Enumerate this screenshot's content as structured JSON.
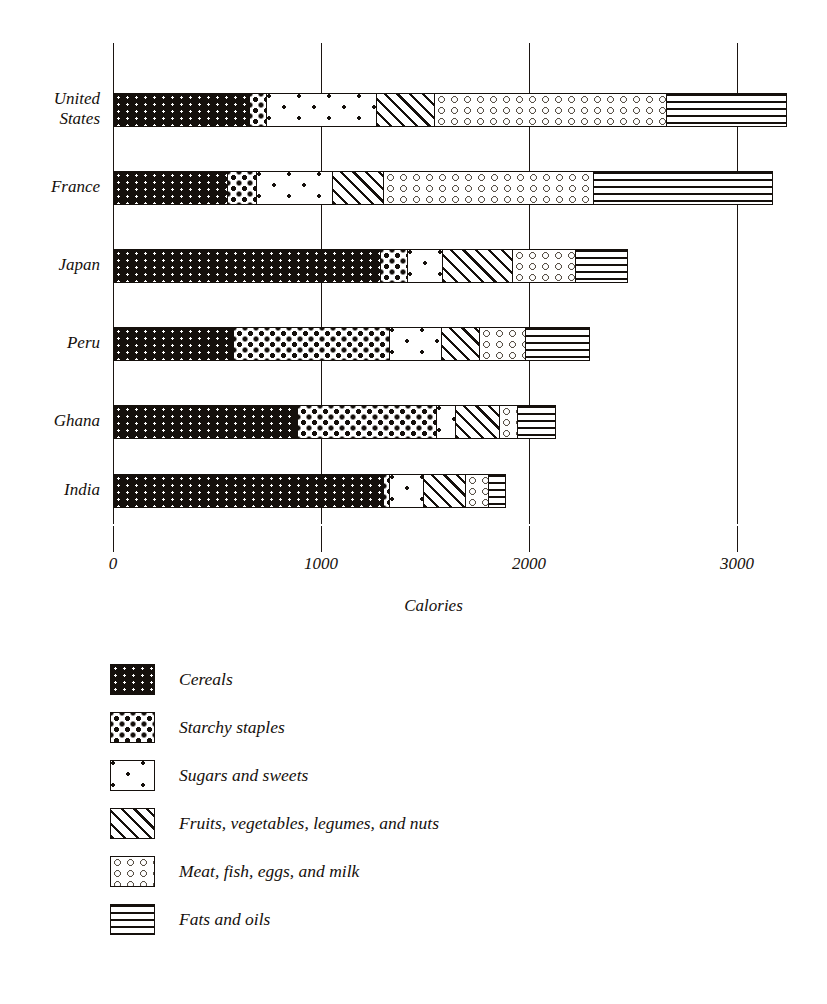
{
  "chart_data": {
    "type": "bar",
    "orientation": "horizontal",
    "stacked": true,
    "title": "",
    "xlabel": "Calories",
    "ylabel": "",
    "xlim": [
      0,
      3400
    ],
    "xticks": [
      0,
      1000,
      2000,
      3000
    ],
    "xticklabels": [
      "0",
      "1000",
      "2000",
      "3000"
    ],
    "grid": "vertical gridlines at each x tick",
    "legend_position": "below plot, left aligned",
    "categories": [
      "United States",
      "France",
      "Japan",
      "Peru",
      "Ghana",
      "India"
    ],
    "series": [
      {
        "name": "Cereals",
        "pattern": "chevron-zigzag",
        "values": [
          654,
          548,
          1288,
          577,
          889,
          1303
        ]
      },
      {
        "name": "Starchy staples",
        "pattern": "dense-dots",
        "values": [
          86,
          144,
          130,
          755,
          671,
          29
        ]
      },
      {
        "name": "Sugars and sweets",
        "pattern": "asterisks",
        "values": [
          529,
          365,
          168,
          250,
          91,
          168
        ]
      },
      {
        "name": "Fruits, vegetables, legumes, and nuts",
        "pattern": "diagonal-hatch",
        "values": [
          279,
          245,
          341,
          183,
          212,
          202
        ]
      },
      {
        "name": "Meat, fish, eggs, and milk",
        "pattern": "open-circles",
        "values": [
          1120,
          1014,
          303,
          226,
          89,
          110
        ]
      },
      {
        "name": "Fats and oils",
        "pattern": "wavy-lines",
        "values": [
          572,
          857,
          246,
          302,
          178,
          77
        ]
      }
    ],
    "totals": [
      3240,
      3173,
      2476,
      2293,
      2130,
      1889
    ]
  },
  "axis": {
    "x_label": "Calories",
    "ticks": [
      "0",
      "1000",
      "2000",
      "3000"
    ]
  },
  "legend": {
    "items": [
      {
        "label": "Cereals",
        "swatch": "chevron-zigzag-swatch"
      },
      {
        "label": "Starchy staples",
        "swatch": "dense-dots-swatch"
      },
      {
        "label": "Sugars and sweets",
        "swatch": "asterisks-swatch"
      },
      {
        "label": "Fruits, vegetables, legumes, and nuts",
        "swatch": "diagonal-hatch-swatch"
      },
      {
        "label": "Meat, fish, eggs, and milk",
        "swatch": "open-circles-swatch"
      },
      {
        "label": "Fats and oils",
        "swatch": "wavy-lines-swatch"
      }
    ]
  },
  "colors": {
    "ink": "#15100c",
    "paper": "#ffffff",
    "muted_ink": "#5a5248"
  }
}
